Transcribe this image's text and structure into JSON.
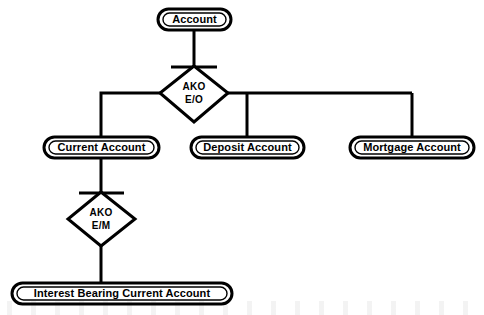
{
  "diagram": {
    "type": "class-hierarchy",
    "colors": {
      "background": "#ffffff",
      "stroke": "#000000",
      "text": "#000000"
    },
    "nodes": {
      "root": {
        "label": "Account",
        "shape": "stadium"
      },
      "current_account": {
        "label": "Current Account",
        "shape": "stadium"
      },
      "deposit_account": {
        "label": "Deposit Account",
        "shape": "stadium"
      },
      "mortgage_account": {
        "label": "Mortgage Account",
        "shape": "stadium"
      },
      "interest_bearing": {
        "label": "Interest Bearing Current Account",
        "shape": "stadium"
      }
    },
    "relations": {
      "ako_eo": {
        "shape": "diamond",
        "line1": "AKO",
        "line2": "E/O",
        "parent": "Account",
        "children": [
          "Current Account",
          "Deposit Account",
          "Mortgage Account"
        ]
      },
      "ako_em": {
        "shape": "diamond",
        "line1": "AKO",
        "line2": "E/M",
        "parent": "Current Account",
        "children": [
          "Interest Bearing Current Account"
        ]
      }
    }
  }
}
